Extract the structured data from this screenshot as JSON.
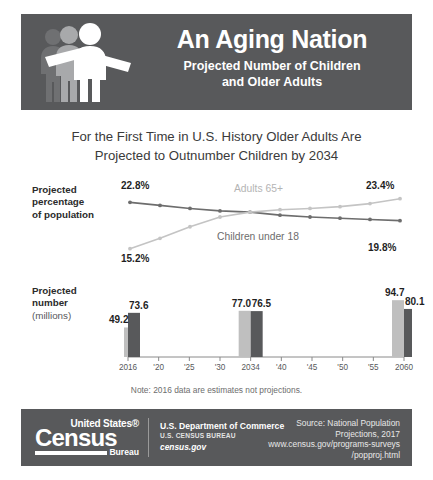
{
  "header": {
    "title": "An Aging Nation",
    "subtitle_line1": "Projected Number of Children",
    "subtitle_line2": "and Older Adults",
    "background_color": "#58595b",
    "icon": "three-people-icon"
  },
  "deck": {
    "line1": "For the First Time in U.S. History Older Adults Are",
    "line2": "Projected to Outnumber Children by 2034"
  },
  "line_chart_label": {
    "line1": "Projected",
    "line2": "percentage",
    "line3": "of population"
  },
  "bar_chart_label": {
    "line1": "Projected",
    "line2": "number",
    "line3": "(millions)"
  },
  "annotations": {
    "children_start": "22.8%",
    "children_end": "19.8%",
    "adults_start": "15.2%",
    "adults_end": "23.4%",
    "bar_2016_adults": "49.2",
    "bar_2016_children": "73.6",
    "bar_2034_adults": "77.0",
    "bar_2034_children": "76.5",
    "bar_2060_adults": "94.7",
    "bar_2060_children": "80.1"
  },
  "note": "Note: 2016 data are estimates not projections.",
  "footer": {
    "logo_us": "United States®",
    "logo_census": "Census",
    "logo_bureau": "Bureau",
    "department": "U.S. Department of Commerce",
    "bureau": "U.S. CENSUS BUREAU",
    "url": "census.gov",
    "source_line1": "Source: National Population",
    "source_line2": "Projections, 2017",
    "source_line3": "www.census.gov/programs-surveys",
    "source_line4": "/popproj.html",
    "background_color": "#58595b"
  },
  "colors": {
    "dark_series": "#6d6d6d",
    "light_series": "#c4c4c4",
    "banner": "#58595b",
    "bar_dark": "#58595b",
    "bar_light": "#bfbfbf"
  },
  "chart_data": [
    {
      "type": "line",
      "title": "Projected percentage of population",
      "xlabel": "",
      "ylabel": "Percentage of population",
      "x": [
        2016,
        2020,
        2025,
        2030,
        2034,
        2040,
        2045,
        2050,
        2055,
        2060
      ],
      "ylim": [
        14,
        24.5
      ],
      "grid": false,
      "legend": "inline-labels",
      "series": [
        {
          "name": "Children under 18",
          "color": "#6d6d6d",
          "values": [
            22.8,
            22.3,
            21.8,
            21.4,
            21.2,
            20.7,
            20.4,
            20.2,
            20.0,
            19.8
          ],
          "start_label": "22.8%",
          "end_label": "19.8%"
        },
        {
          "name": "Adults 65+",
          "color": "#c4c4c4",
          "values": [
            15.2,
            16.9,
            18.8,
            20.4,
            21.2,
            21.6,
            21.8,
            22.1,
            22.6,
            23.4
          ],
          "start_label": "15.2%",
          "end_label": "23.4%"
        }
      ]
    },
    {
      "type": "bar",
      "title": "Projected number (millions)",
      "xlabel": "",
      "ylabel": "Millions",
      "categories": [
        "2016",
        "'20",
        "'25",
        "'30",
        "2034",
        "'40",
        "'45",
        "'50",
        "'55",
        "2060"
      ],
      "ylim": [
        0,
        100
      ],
      "grid": false,
      "series": [
        {
          "name": "Adults 65+",
          "color": "#bfbfbf",
          "values": [
            49.2,
            null,
            null,
            null,
            77.0,
            null,
            null,
            null,
            null,
            94.7
          ]
        },
        {
          "name": "Children under 18",
          "color": "#58595b",
          "values": [
            73.6,
            null,
            null,
            null,
            76.5,
            null,
            null,
            null,
            null,
            80.1
          ]
        }
      ]
    }
  ]
}
